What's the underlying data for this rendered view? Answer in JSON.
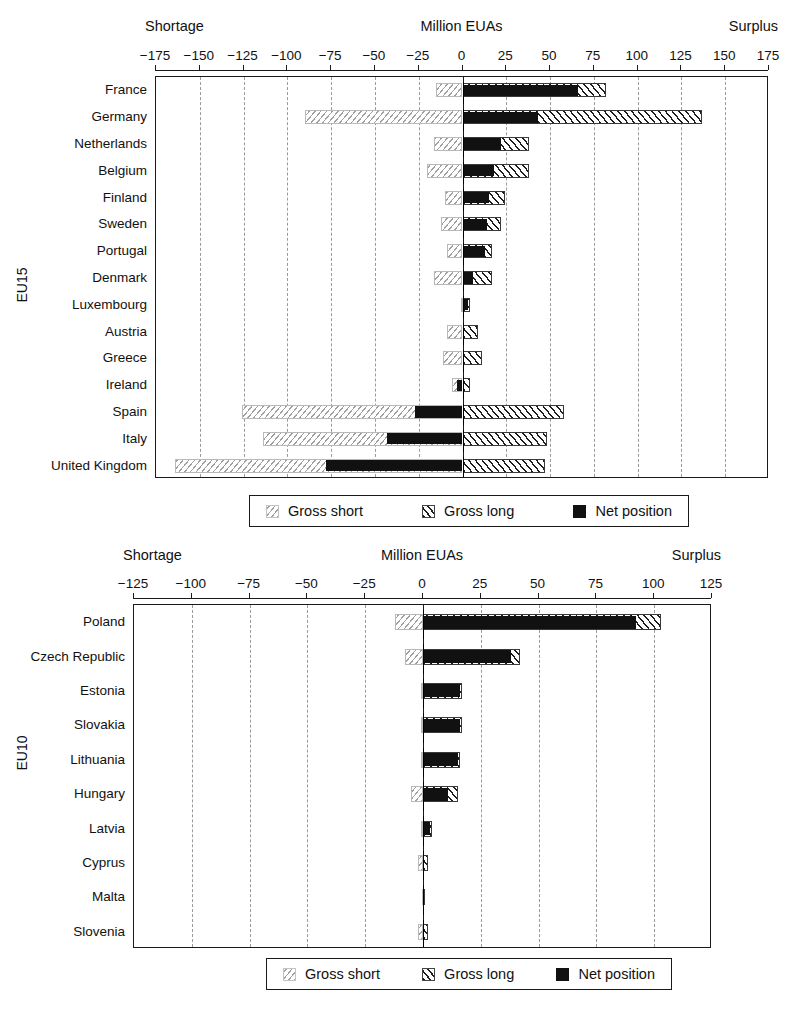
{
  "charts": [
    {
      "id": "eu15",
      "group_label": "EU15",
      "header_left": "Shortage",
      "header_center": "Million EUAs",
      "header_right": "Surplus",
      "legend": {
        "gross_short": "Gross short",
        "gross_long": "Gross long",
        "net_position": "Net position"
      },
      "chart_data": {
        "type": "bar",
        "orientation": "horizontal",
        "title": "Million EUAs",
        "xlabel": "Million EUAs",
        "ylabel": "EU15",
        "xlim": [
          -175,
          175
        ],
        "xticks": [
          -175,
          -150,
          -125,
          -100,
          -75,
          -50,
          -25,
          0,
          25,
          50,
          75,
          100,
          125,
          150,
          175
        ],
        "xticklabels": [
          "−175",
          "−150",
          "−125",
          "−100",
          "−75",
          "−50",
          "−25",
          "0",
          "25",
          "50",
          "75",
          "100",
          "125",
          "150",
          "175"
        ],
        "grid": true,
        "legend_position": "below",
        "categories": [
          "France",
          "Germany",
          "Netherlands",
          "Belgium",
          "Finland",
          "Sweden",
          "Portugal",
          "Denmark",
          "Luxembourg",
          "Austria",
          "Greece",
          "Ireland",
          "Spain",
          "Italy",
          "United Kingdom"
        ],
        "series": [
          {
            "name": "Gross short",
            "values": [
              -15,
              -90,
              -16,
              -20,
              -10,
              -12,
              -9,
              -16,
              -1,
              -9,
              -11,
              -6,
              -126,
              -114,
              -164
            ]
          },
          {
            "name": "Gross long",
            "values": [
              82,
              137,
              38,
              38,
              24,
              22,
              17,
              17,
              4,
              9,
              11,
              4,
              58,
              48,
              47
            ]
          },
          {
            "name": "Net position",
            "values": [
              66,
              43,
              22,
              18,
              15,
              14,
              13,
              6,
              3,
              0,
              0,
              -3,
              -27,
              -43,
              -78
            ]
          }
        ]
      }
    },
    {
      "id": "eu10",
      "group_label": "EU10",
      "header_left": "Shortage",
      "header_center": "Million EUAs",
      "header_right": "Surplus",
      "legend": {
        "gross_short": "Gross short",
        "gross_long": "Gross long",
        "net_position": "Net position"
      },
      "chart_data": {
        "type": "bar",
        "orientation": "horizontal",
        "title": "Million EUAs",
        "xlabel": "Million EUAs",
        "ylabel": "EU10",
        "xlim": [
          -125,
          125
        ],
        "xticks": [
          -125,
          -100,
          -75,
          -50,
          -25,
          0,
          25,
          50,
          75,
          100,
          125
        ],
        "xticklabels": [
          "−125",
          "−100",
          "−75",
          "−50",
          "−25",
          "0",
          "25",
          "50",
          "75",
          "100",
          "125"
        ],
        "grid": true,
        "legend_position": "below",
        "categories": [
          "Poland",
          "Czech Republic",
          "Estonia",
          "Slovakia",
          "Lithuania",
          "Hungary",
          "Latvia",
          "Cyprus",
          "Malta",
          "Slovenia"
        ],
        "series": [
          {
            "name": "Gross short",
            "values": [
              -12,
              -8,
              -1,
              -1,
              -1,
              -5,
              -1,
              -2,
              -0.5,
              -2
            ]
          },
          {
            "name": "Gross long",
            "values": [
              103,
              42,
              17,
              17,
              16,
              15,
              4,
              2,
              0.5,
              2
            ]
          },
          {
            "name": "Net position",
            "values": [
              92,
              38,
              16,
              16,
              15,
              11,
              3,
              0.5,
              0.2,
              0.3
            ]
          }
        ]
      }
    }
  ]
}
